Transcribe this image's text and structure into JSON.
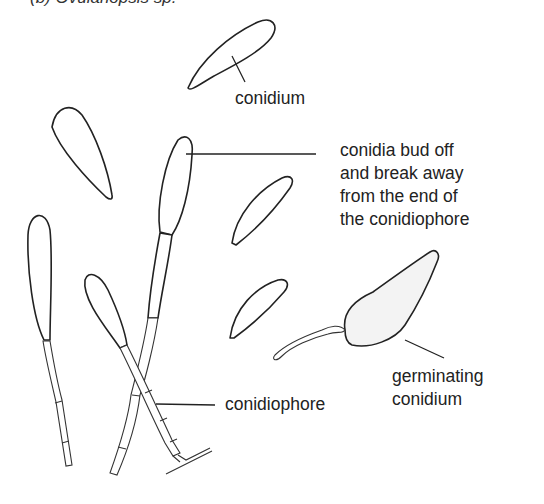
{
  "figure": {
    "caption": "(b)  Ovulariopsis sp.",
    "labels": {
      "conidium": "conidium",
      "bud_off": [
        "conidia bud off",
        "and break away",
        "from the end of",
        "the conidiophore"
      ],
      "germinating": [
        "germinating",
        "conidium"
      ],
      "conidiophore": "conidiophore"
    }
  }
}
